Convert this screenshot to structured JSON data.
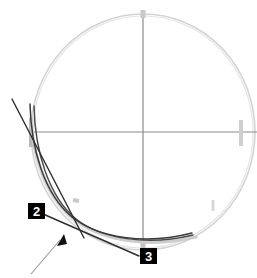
{
  "figure": {
    "background_color": "#ffffff",
    "width": 257,
    "height": 278,
    "colors": {
      "outline_light_gray": "#d0d0d0",
      "axis_gray": "#8a8a8a",
      "curve_dark": "#3a3a3a",
      "tangent_dark": "#2a2a2a",
      "leader_gray": "#9a9a9a",
      "tick_gray": "#c4c4c4",
      "callout_fill": "#000000",
      "callout_text": "#ffffff"
    },
    "circle": {
      "label": "outer boundary circle",
      "center_x": 143,
      "center_y": 132,
      "radius_x": 112,
      "radius_y": 118
    },
    "axes": {
      "horizontal_label": "horizontal center axis",
      "horizontal_y": 132,
      "horizontal_x1": 30,
      "horizontal_x2": 256,
      "vertical_label": "vertical center axis",
      "vertical_x": 143,
      "vertical_y1": 14,
      "vertical_y2": 246
    },
    "ticks": [
      {
        "name": "tick-top",
        "x": 143,
        "y": 14
      },
      {
        "name": "tick-left",
        "x": 31,
        "y": 132
      },
      {
        "name": "tick-right",
        "x": 240,
        "y": 132
      },
      {
        "name": "tick-bottom",
        "x": 143,
        "y": 245
      },
      {
        "name": "tick-lower-left",
        "x": 72,
        "y": 204
      },
      {
        "name": "tick-lower-right",
        "x": 213,
        "y": 206
      }
    ],
    "curves": [
      {
        "name": "curve-inner",
        "description": "inner dark profile curve descending from upper-left to bottom-right"
      },
      {
        "name": "curve-outer",
        "description": "outer dark profile curve running parallel to inner curve"
      },
      {
        "name": "curve-gray-shadow",
        "description": "light gray shadow curve offset from the dark curves"
      }
    ],
    "tangent_lines": [
      {
        "name": "tangent-upper-left",
        "x1": 12,
        "y1": 99,
        "x2": 84,
        "y2": 238
      },
      {
        "name": "tangent-lower",
        "x1": 43,
        "y1": 214,
        "x2": 139,
        "y2": 256
      }
    ],
    "leader_arrow": {
      "name": "leader-arrow",
      "tail_x": 31,
      "tail_y": 274,
      "head_x": 63,
      "head_y": 236
    },
    "callouts": [
      {
        "id": "callout-2",
        "label": "2",
        "x": 28,
        "y": 203
      },
      {
        "id": "callout-3",
        "label": "3",
        "x": 140,
        "y": 248
      }
    ]
  }
}
